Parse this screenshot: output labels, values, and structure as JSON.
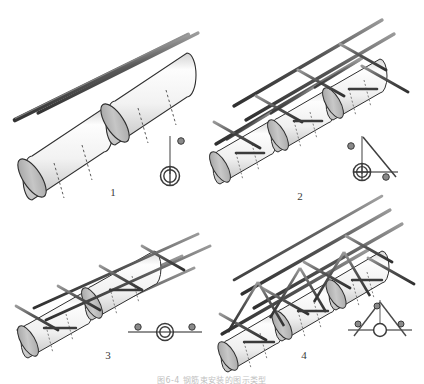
{
  "figure": {
    "caption": "图6-4 钢筋束安装的图示类型",
    "panel_count": 4
  },
  "panels": [
    {
      "number": "1",
      "name": "single-layer-two-cylinder-assembly",
      "cylinders": 2,
      "legend": {
        "name": "vertical-bar-section-symbol",
        "lines": [
          "vertical"
        ],
        "dots": 1,
        "ring": "double"
      }
    },
    {
      "number": "2",
      "name": "triangular-truss-cage-assembly",
      "cylinders": 3,
      "legend": {
        "name": "right-triangle-section-symbol",
        "lines": [
          "vertical",
          "horizontal",
          "diagonal"
        ],
        "dots": 2,
        "ring": "double-crossed"
      }
    },
    {
      "number": "3",
      "name": "flat-ladder-cage-assembly",
      "cylinders": 2,
      "legend": {
        "name": "horizontal-bar-section-symbol",
        "lines": [
          "horizontal"
        ],
        "dots": 2,
        "ring": "double"
      }
    },
    {
      "number": "4",
      "name": "space-truss-cage-assembly",
      "cylinders": 3,
      "legend": {
        "name": "tripod-section-symbol",
        "lines": [
          "left-diagonal",
          "right-diagonal",
          "horizontal",
          "vertical"
        ],
        "dots": 3,
        "ring": "single"
      }
    }
  ],
  "colors": {
    "bar_dark": "#4a4a4a",
    "bar_mid": "#6e6e6e",
    "bar_light": "#9a9a9a",
    "cylinder_body_light": "#fbfbfb",
    "cylinder_body_shade": "#cfcfcf",
    "cylinder_cap": "#b5b5b5",
    "outline": "#2e2e2e",
    "dash": "#5a5a5a",
    "legend_line": "#6b6b6b",
    "caption_text": "#8d8d8d"
  }
}
